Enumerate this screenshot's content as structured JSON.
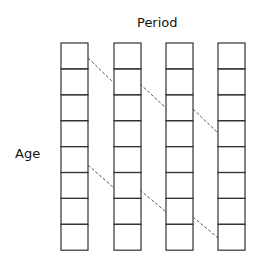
{
  "diagram": {
    "top_label": "Period",
    "side_label": "Age",
    "columns": 4,
    "rows": 8,
    "geometry": {
      "column_x": [
        61,
        114,
        166,
        218
      ],
      "column_width": 27,
      "top_y": 43,
      "row_height": 25.9
    },
    "cohort_lines": [
      {
        "segments": [
          [
            88,
            58,
            114,
            83
          ],
          [
            140,
            84,
            166,
            108
          ],
          [
            193,
            109,
            218,
            133
          ]
        ]
      },
      {
        "segments": [
          [
            88,
            165,
            114,
            188
          ],
          [
            140,
            190,
            166,
            212
          ],
          [
            193,
            217,
            218,
            238
          ]
        ]
      }
    ],
    "colors": {
      "stroke": "#333333",
      "dash": "#555555"
    }
  }
}
